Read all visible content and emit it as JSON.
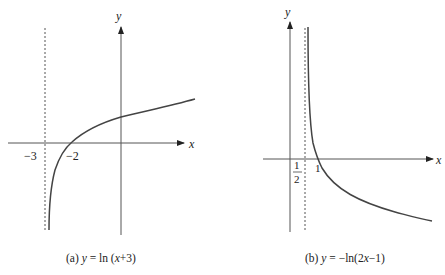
{
  "panels": [
    {
      "id": "a",
      "caption_prefix": "(a)",
      "caption_y": "y",
      "caption_rest": " = ln (",
      "caption_x": "x",
      "caption_end": "+3)",
      "function": "y = ln(x+3)",
      "x_axis_label": "x",
      "y_axis_label": "y",
      "asymptote": "x = -3",
      "tick_labels": [
        "−3",
        "−2"
      ]
    },
    {
      "id": "b",
      "caption_prefix": "(b)",
      "caption_y": "y",
      "caption_rest": " = −ln(2",
      "caption_x": "x",
      "caption_end": "−1)",
      "function": "y = -ln(2x-1)",
      "x_axis_label": "x",
      "y_axis_label": "y",
      "asymptote": "x = 1/2",
      "tick_labels": [
        "1",
        "2",
        "1"
      ]
    }
  ],
  "colors": {
    "ink": "#333333",
    "background": "#ffffff"
  }
}
